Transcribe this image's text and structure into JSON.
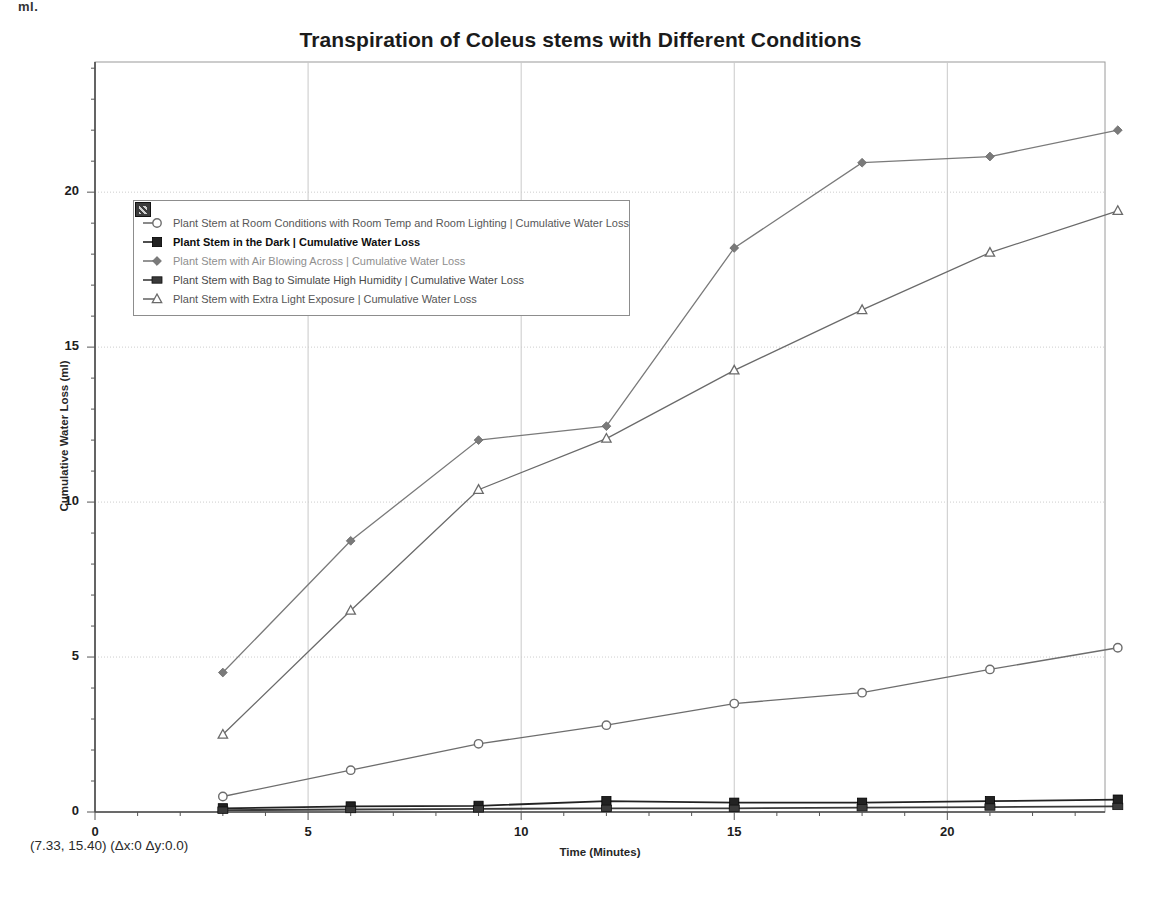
{
  "page": {
    "corner_text": "ml."
  },
  "status": {
    "readout": "(7.33, 15.40) (Δx:0 Δy:0.0)"
  },
  "legend": {
    "grip_icon": "resize-grip-icon",
    "items": [
      {
        "marker": "open-circle",
        "label": "Plant Stem at Room Conditions with Room Temp and Room Lighting | Cumulative Water Loss"
      },
      {
        "marker": "filled-square",
        "label": "Plant Stem in the Dark | Cumulative Water Loss"
      },
      {
        "marker": "filled-diamond",
        "label": "Plant Stem with Air Blowing Across | Cumulative Water Loss"
      },
      {
        "marker": "filled-rect",
        "label": "Plant Stem with Bag to Simulate High Humidity | Cumulative Water Loss"
      },
      {
        "marker": "open-triangle",
        "label": "Plant Stem with Extra Light Exposure | Cumulative Water Loss"
      }
    ]
  },
  "chart_data": {
    "type": "line",
    "title": "Transpiration of Coleus stems with Different Conditions",
    "xlabel": "Time (Minutes)",
    "ylabel": "Cumulative Water Loss (ml)",
    "xlim": [
      0,
      23.7
    ],
    "ylim": [
      0,
      24.2
    ],
    "xticks": [
      0,
      5,
      10,
      15,
      20
    ],
    "yticks": [
      0,
      5,
      10,
      15,
      20
    ],
    "x_minor_step": 1,
    "y_minor_step": 1,
    "grid": true,
    "legend_position": "upper-left-inside",
    "x": [
      3,
      6,
      9,
      12,
      15,
      18,
      21,
      24
    ],
    "series": [
      {
        "name": "Plant Stem at Room Conditions with Room Temp and Room Lighting | Cumulative Water Loss",
        "marker": "open-circle",
        "color": "#6d6d6d",
        "values": [
          0.5,
          1.35,
          2.2,
          2.8,
          3.5,
          3.85,
          4.6,
          5.3
        ]
      },
      {
        "name": "Plant Stem in the Dark | Cumulative Water Loss",
        "marker": "filled-square",
        "color": "#222222",
        "values": [
          0.12,
          0.18,
          0.2,
          0.35,
          0.3,
          0.3,
          0.35,
          0.4
        ]
      },
      {
        "name": "Plant Stem with Air Blowing Across | Cumulative Water Loss",
        "marker": "filled-diamond",
        "color": "#7a7a7a",
        "values": [
          4.5,
          8.75,
          12.0,
          12.45,
          18.2,
          20.95,
          21.15,
          22.0
        ]
      },
      {
        "name": "Plant Stem with Bag to Simulate High Humidity | Cumulative Water Loss",
        "marker": "filled-rect",
        "color": "#3a3a3a",
        "values": [
          0.06,
          0.08,
          0.1,
          0.12,
          0.12,
          0.14,
          0.16,
          0.18
        ]
      },
      {
        "name": "Plant Stem with Extra Light Exposure | Cumulative Water Loss",
        "marker": "open-triangle",
        "color": "#6a6a6a",
        "values": [
          2.5,
          6.5,
          10.4,
          12.05,
          14.25,
          16.2,
          18.05,
          19.4
        ]
      }
    ]
  }
}
